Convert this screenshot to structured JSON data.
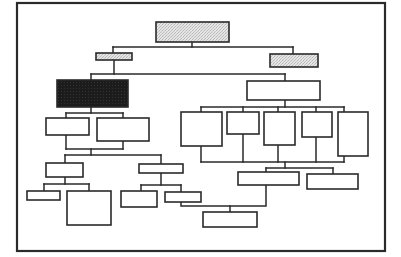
{
  "diagram": {
    "type": "org-chart",
    "frame": {
      "x": 17,
      "y": 3,
      "w": 368,
      "h": 248
    },
    "colors": {
      "line": "#2a2a2a",
      "white": "#ffffff",
      "gray": "#d8d8d8",
      "black": "#1a1a1a"
    },
    "nodes": [
      {
        "id": "root",
        "x": 156,
        "y": 22,
        "w": 73,
        "h": 20,
        "fill": "gray"
      },
      {
        "id": "l1-left",
        "x": 96,
        "y": 53,
        "w": 36,
        "h": 7,
        "fill": "gray"
      },
      {
        "id": "l1-right",
        "x": 270,
        "y": 54,
        "w": 48,
        "h": 13,
        "fill": "gray"
      },
      {
        "id": "highlighted",
        "x": 57,
        "y": 80,
        "w": 71,
        "h": 27,
        "fill": "black"
      },
      {
        "id": "right-hub",
        "x": 247,
        "y": 81,
        "w": 73,
        "h": 19,
        "fill": "white"
      },
      {
        "id": "hl-child-1",
        "x": 46,
        "y": 118,
        "w": 43,
        "h": 17,
        "fill": "white"
      },
      {
        "id": "hl-child-2",
        "x": 97,
        "y": 118,
        "w": 52,
        "h": 23,
        "fill": "white"
      },
      {
        "id": "hub-child-1",
        "x": 181,
        "y": 112,
        "w": 41,
        "h": 34,
        "fill": "white"
      },
      {
        "id": "hub-child-2",
        "x": 227,
        "y": 112,
        "w": 32,
        "h": 22,
        "fill": "white"
      },
      {
        "id": "hub-child-3",
        "x": 264,
        "y": 112,
        "w": 31,
        "h": 33,
        "fill": "white"
      },
      {
        "id": "hub-child-4",
        "x": 302,
        "y": 112,
        "w": 30,
        "h": 25,
        "fill": "white"
      },
      {
        "id": "hub-child-5",
        "x": 338,
        "y": 112,
        "w": 30,
        "h": 44,
        "fill": "white"
      },
      {
        "id": "sub-left",
        "x": 46,
        "y": 163,
        "w": 37,
        "h": 14,
        "fill": "white"
      },
      {
        "id": "sub-mid",
        "x": 139,
        "y": 164,
        "w": 44,
        "h": 9,
        "fill": "white"
      },
      {
        "id": "leaf-l1",
        "x": 27,
        "y": 191,
        "w": 33,
        "h": 9,
        "fill": "white"
      },
      {
        "id": "leaf-l2",
        "x": 67,
        "y": 191,
        "w": 44,
        "h": 34,
        "fill": "white"
      },
      {
        "id": "leaf-m1",
        "x": 121,
        "y": 191,
        "w": 36,
        "h": 16,
        "fill": "white"
      },
      {
        "id": "leaf-m2",
        "x": 165,
        "y": 192,
        "w": 36,
        "h": 10,
        "fill": "white"
      },
      {
        "id": "merge-1",
        "x": 238,
        "y": 172,
        "w": 61,
        "h": 13,
        "fill": "white"
      },
      {
        "id": "merge-2",
        "x": 307,
        "y": 174,
        "w": 51,
        "h": 15,
        "fill": "white"
      },
      {
        "id": "bottom",
        "x": 203,
        "y": 212,
        "w": 54,
        "h": 15,
        "fill": "white"
      }
    ],
    "edges": [
      {
        "id": "root-stem",
        "points": [
          [
            192,
            42
          ],
          [
            192,
            47
          ]
        ]
      },
      {
        "id": "root-bus",
        "points": [
          [
            113,
            47
          ],
          [
            293,
            47
          ]
        ]
      },
      {
        "id": "to-l1-left",
        "points": [
          [
            113,
            47
          ],
          [
            113,
            53
          ]
        ]
      },
      {
        "id": "to-l1-right",
        "points": [
          [
            293,
            47
          ],
          [
            293,
            54
          ]
        ]
      },
      {
        "id": "l1-left-stem",
        "points": [
          [
            114,
            60
          ],
          [
            114,
            74
          ]
        ]
      },
      {
        "id": "l1-bus",
        "points": [
          [
            91,
            74
          ],
          [
            285,
            74
          ]
        ]
      },
      {
        "id": "to-highlighted",
        "points": [
          [
            91,
            74
          ],
          [
            91,
            80
          ]
        ]
      },
      {
        "id": "to-right-hub",
        "points": [
          [
            285,
            74
          ],
          [
            285,
            81
          ]
        ]
      },
      {
        "id": "hl-stem",
        "points": [
          [
            91,
            107
          ],
          [
            91,
            113
          ]
        ]
      },
      {
        "id": "hl-bus",
        "points": [
          [
            66,
            113
          ],
          [
            123,
            113
          ]
        ]
      },
      {
        "id": "to-hl-child-1",
        "points": [
          [
            66,
            113
          ],
          [
            66,
            118
          ]
        ]
      },
      {
        "id": "to-hl-child-2",
        "points": [
          [
            123,
            113
          ],
          [
            123,
            118
          ]
        ]
      },
      {
        "id": "hl-merge-1",
        "points": [
          [
            66,
            135
          ],
          [
            66,
            149
          ]
        ]
      },
      {
        "id": "hl-merge-2",
        "points": [
          [
            123,
            141
          ],
          [
            123,
            149
          ]
        ]
      },
      {
        "id": "hl-merge-bus",
        "points": [
          [
            66,
            149
          ],
          [
            123,
            149
          ]
        ]
      },
      {
        "id": "hl-merge-stem",
        "points": [
          [
            91,
            149
          ],
          [
            91,
            155
          ]
        ]
      },
      {
        "id": "low-bus",
        "points": [
          [
            65,
            155
          ],
          [
            161,
            155
          ]
        ]
      },
      {
        "id": "to-sub-left",
        "points": [
          [
            65,
            155
          ],
          [
            65,
            163
          ]
        ]
      },
      {
        "id": "to-sub-mid",
        "points": [
          [
            161,
            155
          ],
          [
            161,
            164
          ]
        ]
      },
      {
        "id": "sub-left-stem",
        "points": [
          [
            65,
            177
          ],
          [
            65,
            184
          ]
        ]
      },
      {
        "id": "sub-left-bus",
        "points": [
          [
            44,
            184
          ],
          [
            89,
            184
          ]
        ]
      },
      {
        "id": "to-leaf-l1",
        "points": [
          [
            44,
            184
          ],
          [
            44,
            191
          ]
        ]
      },
      {
        "id": "to-leaf-l2",
        "points": [
          [
            89,
            184
          ],
          [
            89,
            191
          ]
        ]
      },
      {
        "id": "sub-mid-stem",
        "points": [
          [
            161,
            173
          ],
          [
            161,
            185
          ]
        ]
      },
      {
        "id": "sub-mid-bus",
        "points": [
          [
            141,
            185
          ],
          [
            181,
            185
          ]
        ]
      },
      {
        "id": "to-leaf-m1",
        "points": [
          [
            141,
            185
          ],
          [
            141,
            191
          ]
        ]
      },
      {
        "id": "to-leaf-m2",
        "points": [
          [
            181,
            185
          ],
          [
            181,
            192
          ]
        ]
      },
      {
        "id": "hub-stem",
        "points": [
          [
            285,
            100
          ],
          [
            285,
            107
          ]
        ]
      },
      {
        "id": "hub-bus",
        "points": [
          [
            201,
            107
          ],
          [
            344,
            107
          ]
        ]
      },
      {
        "id": "to-hub-child-1",
        "points": [
          [
            201,
            107
          ],
          [
            201,
            112
          ]
        ]
      },
      {
        "id": "to-hub-child-2",
        "points": [
          [
            243,
            107
          ],
          [
            243,
            112
          ]
        ]
      },
      {
        "id": "to-hub-child-3",
        "points": [
          [
            278,
            107
          ],
          [
            278,
            112
          ]
        ]
      },
      {
        "id": "to-hub-child-4",
        "points": [
          [
            316,
            107
          ],
          [
            316,
            112
          ]
        ]
      },
      {
        "id": "to-hub-child-5",
        "points": [
          [
            344,
            107
          ],
          [
            344,
            112
          ]
        ]
      },
      {
        "id": "from-hub-child-1",
        "points": [
          [
            201,
            146
          ],
          [
            201,
            162
          ]
        ]
      },
      {
        "id": "from-hub-child-2",
        "points": [
          [
            243,
            134
          ],
          [
            243,
            162
          ]
        ]
      },
      {
        "id": "from-hub-child-3",
        "points": [
          [
            278,
            145
          ],
          [
            278,
            162
          ]
        ]
      },
      {
        "id": "from-hub-child-4",
        "points": [
          [
            316,
            137
          ],
          [
            316,
            162
          ]
        ]
      },
      {
        "id": "from-hub-child-5",
        "points": [
          [
            344,
            156
          ],
          [
            344,
            162
          ]
        ]
      },
      {
        "id": "hub-merge-bus",
        "points": [
          [
            201,
            162
          ],
          [
            344,
            162
          ]
        ]
      },
      {
        "id": "hub-merge-stem",
        "points": [
          [
            285,
            162
          ],
          [
            285,
            168
          ]
        ]
      },
      {
        "id": "merge-bus",
        "points": [
          [
            266,
            168
          ],
          [
            333,
            168
          ]
        ]
      },
      {
        "id": "to-merge-1",
        "points": [
          [
            266,
            168
          ],
          [
            266,
            172
          ]
        ]
      },
      {
        "id": "to-merge-2",
        "points": [
          [
            333,
            168
          ],
          [
            333,
            174
          ]
        ]
      },
      {
        "id": "merge-1-down",
        "points": [
          [
            266,
            185
          ],
          [
            266,
            206
          ],
          [
            181,
            206
          ],
          [
            181,
            202
          ]
        ]
      },
      {
        "id": "to-bottom",
        "points": [
          [
            230,
            206
          ],
          [
            230,
            212
          ]
        ]
      }
    ]
  }
}
